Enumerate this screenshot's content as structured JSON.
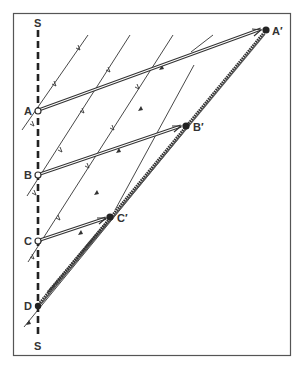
{
  "diagram": {
    "colors": {
      "ink": "#333333",
      "background": "#ffffff",
      "border": "#555555"
    },
    "axis": {
      "top_label": "S",
      "bottom_label": "S",
      "style": "dashed-vertical"
    },
    "points_on_axis": [
      {
        "id": "A",
        "label": "A",
        "marker": "open-circle"
      },
      {
        "id": "B",
        "label": "B",
        "marker": "open-circle"
      },
      {
        "id": "C",
        "label": "C",
        "marker": "open-circle"
      },
      {
        "id": "D",
        "label": "D",
        "marker": "filled-circle"
      }
    ],
    "image_points": [
      {
        "id": "A_prime",
        "label": "A′",
        "marker": "filled-circle"
      },
      {
        "id": "B_prime",
        "label": "B′",
        "marker": "filled-circle"
      },
      {
        "id": "C_prime",
        "label": "C′",
        "marker": "filled-circle"
      }
    ],
    "connections": [
      {
        "from": "A",
        "to": "A′",
        "style": "double-line-arrow"
      },
      {
        "from": "B",
        "to": "B′",
        "style": "double-line-arrow"
      },
      {
        "from": "C",
        "to": "C′",
        "style": "double-line-arrow"
      }
    ],
    "front_line": {
      "from": "D",
      "to": "A′",
      "style": "thick-zigzag"
    },
    "parallel_lines": {
      "count": 6,
      "style": "thin-with-ticks"
    }
  }
}
